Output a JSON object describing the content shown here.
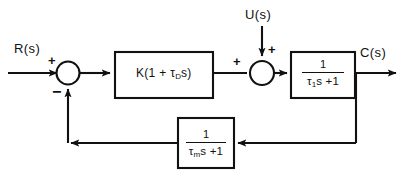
{
  "diagram": {
    "type": "control-system-block-diagram",
    "background_color": "#ffffff",
    "line_color": "#111111",
    "signals": {
      "reference_input": "R(s)",
      "disturbance_input": "U(s)",
      "output": "C(s)"
    },
    "summing_junction_1": {
      "name": "error-summing-junction",
      "plus_sign": "+",
      "minus_sign": "−",
      "inputs": [
        "R(s)",
        "feedback"
      ]
    },
    "summing_junction_2": {
      "name": "disturbance-summing-junction",
      "plus_sign_left": "+",
      "plus_sign_top": "+",
      "inputs": [
        "controller output",
        "U(s)"
      ]
    },
    "blocks": [
      {
        "name": "controller-block",
        "expression": "K(1 + τ",
        "subscript": "D",
        "expression_tail": "s)",
        "kind": "inline"
      },
      {
        "name": "plant-block",
        "numerator": "1",
        "denominator_lead": "τ",
        "denominator_subscript": "1",
        "denominator_tail": "s +1",
        "kind": "fraction"
      },
      {
        "name": "feedback-block",
        "numerator": "1",
        "denominator_lead": "τ",
        "denominator_subscript": "m",
        "denominator_tail": "s +1",
        "kind": "fraction"
      }
    ]
  }
}
